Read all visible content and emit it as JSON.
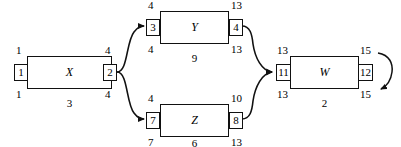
{
  "diagram": {
    "type": "activity-on-node network diagram",
    "nodes": [
      {
        "id": "x",
        "label": "X",
        "early_start": "1",
        "early_finish": "4",
        "late_start": "1",
        "late_finish": "4",
        "start_box": "1",
        "finish_box": "2",
        "duration": "3"
      },
      {
        "id": "y",
        "label": "Y",
        "early_start": "4",
        "early_finish": "13",
        "late_start": "4",
        "late_finish": "13",
        "start_box": "3",
        "finish_box": "4",
        "duration": "9"
      },
      {
        "id": "z",
        "label": "Z",
        "early_start": "4",
        "early_finish": "10",
        "late_start": "7",
        "late_finish": "13",
        "start_box": "7",
        "finish_box": "8",
        "duration": "6"
      },
      {
        "id": "w",
        "label": "W",
        "early_start": "13",
        "early_finish": "15",
        "late_start": "13",
        "late_finish": "15",
        "start_box": "11",
        "finish_box": "12",
        "duration": "2"
      }
    ],
    "edges": [
      {
        "from": "x",
        "to": "y",
        "style": "curved-arrow"
      },
      {
        "from": "x",
        "to": "z",
        "style": "curved-arrow"
      },
      {
        "from": "y",
        "to": "w",
        "style": "curved-arrow"
      },
      {
        "from": "z",
        "to": "w",
        "style": "curved-arrow"
      },
      {
        "from": "w",
        "to": "w",
        "style": "curved-loop-arrow"
      }
    ]
  }
}
